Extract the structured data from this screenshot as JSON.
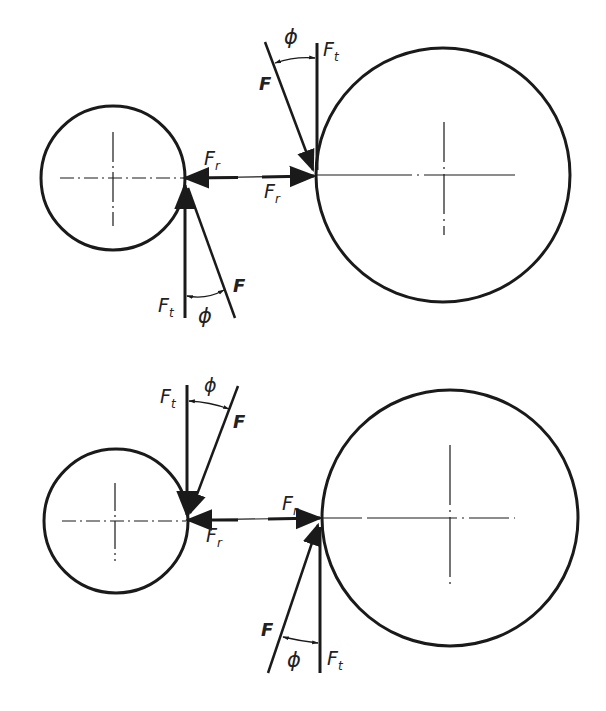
{
  "diagram": {
    "type": "gear force diagram",
    "colors": {
      "line": "#1a1a1a",
      "background": "#ffffff"
    },
    "top": {
      "pinion": {
        "cx": 113,
        "cy": 178,
        "r": 72
      },
      "gear": {
        "cx": 443,
        "cy": 175,
        "r": 127
      },
      "labels": {
        "F_upper": "F",
        "phi_upper": "ϕ",
        "Ft_upper": "F",
        "Ft_upper_sub": "t",
        "Fr_left": "F",
        "Fr_left_sub": "r",
        "Fr_right": "F",
        "Fr_right_sub": "r",
        "Ft_lower": "F",
        "Ft_lower_sub": "t",
        "phi_lower": "ϕ",
        "F_lower": "F"
      }
    },
    "bottom": {
      "pinion": {
        "cx": 115,
        "cy": 521,
        "r": 72
      },
      "gear": {
        "cx": 450,
        "cy": 518,
        "r": 128
      },
      "labels": {
        "Ft_upper": "F",
        "Ft_upper_sub": "t",
        "phi_upper": "ϕ",
        "F_upper": "F",
        "Fr_upper": "F",
        "Fr_upper_sub": "r",
        "Fr_lower": "F",
        "Fr_lower_sub": "r",
        "F_lower": "F",
        "phi_lower": "ϕ",
        "Ft_lower": "F",
        "Ft_lower_sub": "t"
      }
    }
  }
}
